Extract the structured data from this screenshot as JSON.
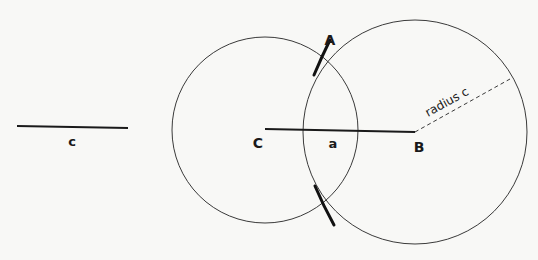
{
  "diagram": {
    "background": "#f8f8f6",
    "stroke_color": "#1a1a1a",
    "thin_stroke": "#3a3a3a",
    "given_segment": {
      "label": "c",
      "x1": 17,
      "y1": 126,
      "x2": 128,
      "y2": 128,
      "label_x": 72,
      "label_y": 146
    },
    "base_line": {
      "from_label": "C",
      "to_label": "B",
      "mid_label": "a",
      "x1": 265,
      "y1": 129,
      "x2": 415,
      "y2": 132
    },
    "points": [
      {
        "name": "A",
        "label": "A",
        "x": 322,
        "y": 49,
        "label_x": 330,
        "label_y": 45
      },
      {
        "name": "C",
        "label": "C",
        "x": 265,
        "y": 129,
        "label_x": 258,
        "label_y": 148
      },
      {
        "name": "B",
        "label": "B",
        "x": 415,
        "y": 132,
        "label_x": 419,
        "label_y": 152
      }
    ],
    "side_label": {
      "label": "a",
      "x": 333,
      "y": 148
    },
    "circles": [
      {
        "name": "circle-centered-c",
        "cx": 265,
        "cy": 130,
        "r": 93
      },
      {
        "name": "circle-centered-b",
        "cx": 415,
        "cy": 132,
        "r": 112
      }
    ],
    "radius_line": {
      "label": "radius c",
      "x1": 415,
      "y1": 132,
      "x2": 510,
      "y2": 79,
      "label_x": 428,
      "label_y": 117,
      "angle": -29
    },
    "bold_arcs": [
      {
        "name": "upper-arc-at-a",
        "path": "M 330 40 Q 322 56 314 75"
      },
      {
        "name": "lower-arc",
        "path": "M 315 186 Q 323 205 334 225"
      }
    ]
  }
}
